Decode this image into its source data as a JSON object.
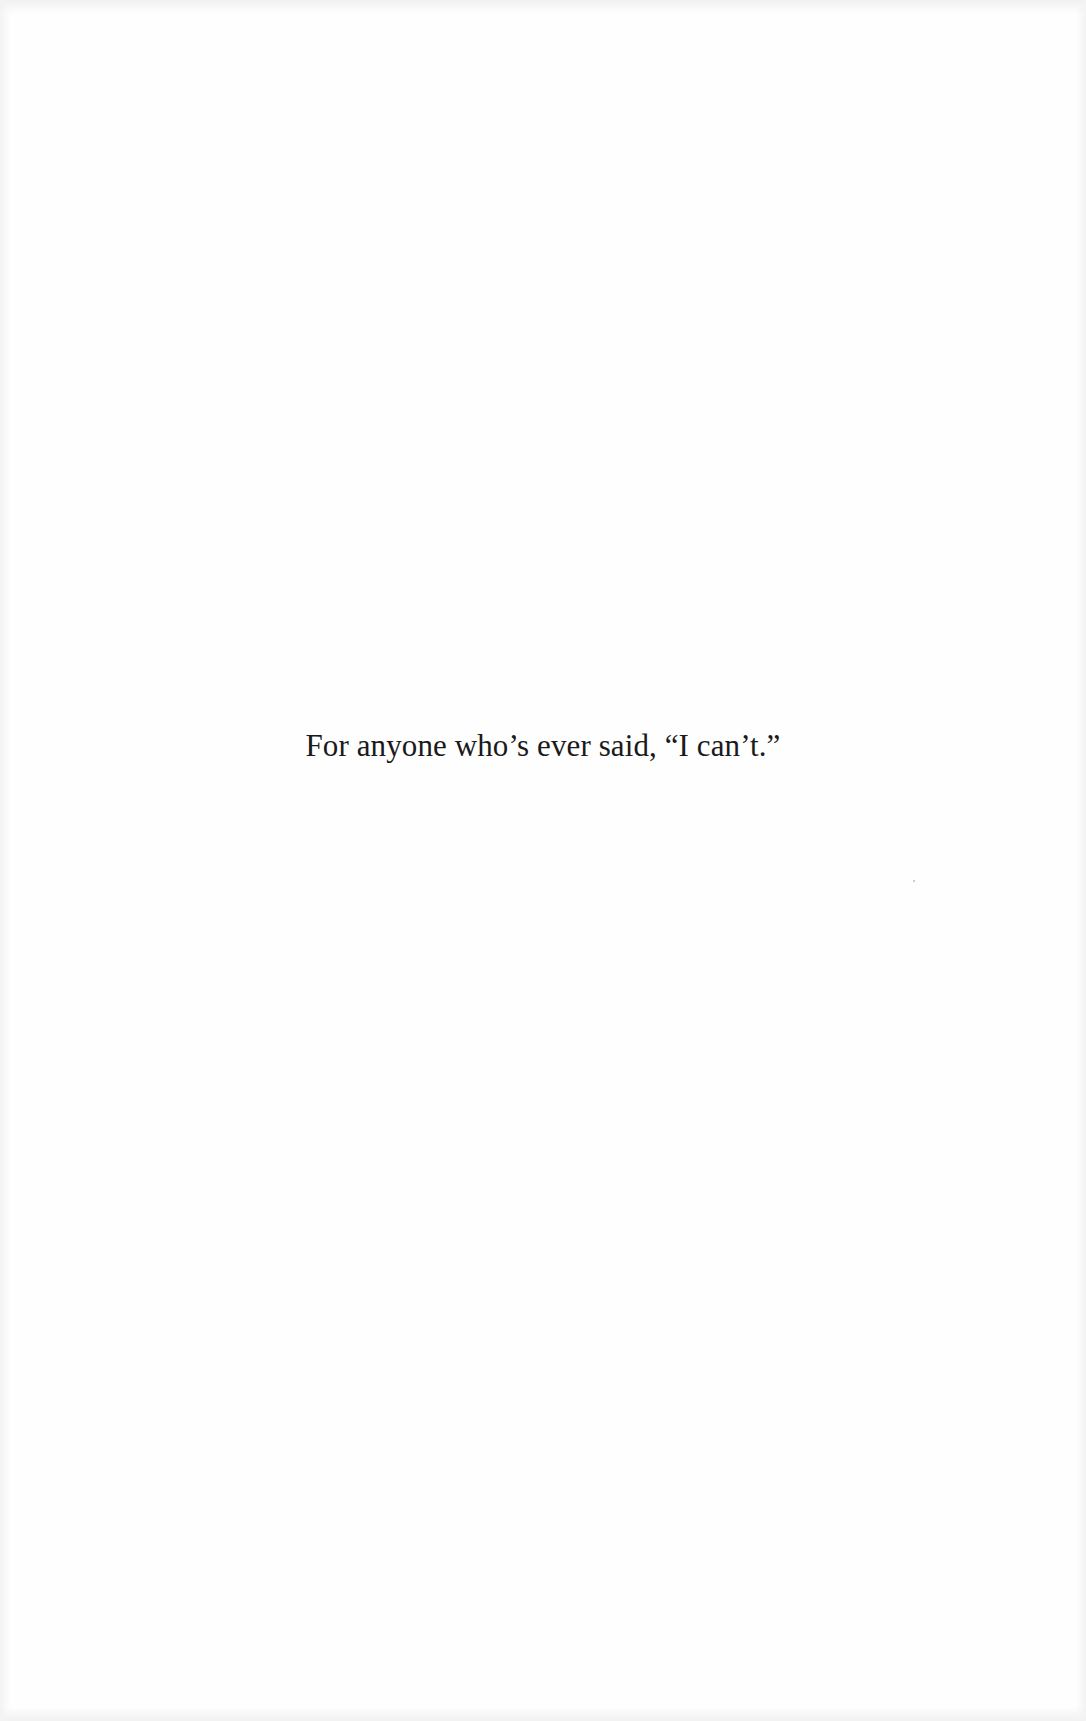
{
  "page": {
    "type": "dedication",
    "background_color": "#fefefe",
    "text_color": "#1a1a1a"
  },
  "dedication": {
    "text": "For anyone who’s ever said, “I can’t.”"
  }
}
